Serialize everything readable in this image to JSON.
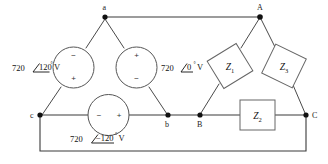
{
  "diagram": {
    "background_color": "#ffffff",
    "wire_color": "#3a3a3a"
  },
  "nodes": {
    "source_top": "a",
    "source_bottom_left": "c",
    "source_bottom_right": "b",
    "load_top": "A",
    "load_bottom_left": "B",
    "load_bottom_right": "C"
  },
  "sources": [
    {
      "id": "source-left",
      "magnitude": "720",
      "angle": "120",
      "angle_symbol": "∠",
      "degree": "°",
      "unit": "V",
      "label_full": "720 ∠120° V",
      "terminal_top": "−",
      "terminal_bottom": "+"
    },
    {
      "id": "source-right",
      "magnitude": "720",
      "angle": "0",
      "angle_symbol": "∠",
      "degree": "°",
      "unit": "V",
      "label_full": "720 ∠0° V",
      "terminal_top": "+",
      "terminal_bottom": "−"
    },
    {
      "id": "source-bottom",
      "magnitude": "720",
      "angle": "−120",
      "angle_symbol": "∠",
      "degree": "°",
      "unit": "V",
      "label_full": "720 ∠−120° V",
      "terminal_left": "−",
      "terminal_right": "+"
    }
  ],
  "impedances": [
    {
      "id": "z1",
      "symbol": "Z",
      "subscript": "1",
      "label": "Z₁"
    },
    {
      "id": "z2",
      "symbol": "Z",
      "subscript": "2",
      "label": "Z₂"
    },
    {
      "id": "z3",
      "symbol": "Z",
      "subscript": "3",
      "label": "Z₃"
    }
  ]
}
